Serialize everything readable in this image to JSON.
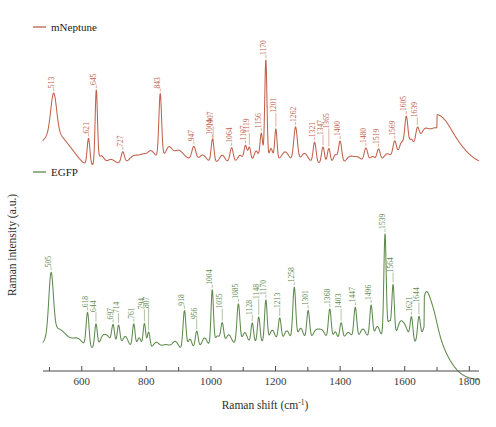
{
  "chart_data": {
    "type": "line",
    "title": "",
    "xlabel": "Raman shift (cm⁻¹)",
    "xlabel_main": "Raman shift (cm",
    "xlabel_sup": "-1",
    "xlabel_tail": ")",
    "ylabel": "Raman intensity (a.u.)",
    "xlim": [
      480,
      1830
    ],
    "grid": false,
    "legend_position": "top-left",
    "xticks_major": [
      600,
      800,
      1000,
      1200,
      1400,
      1600,
      1800
    ],
    "xticks_minor": [
      500,
      700,
      900,
      1100,
      1300,
      1500,
      1700
    ],
    "series": [
      {
        "name": "mNeptune",
        "color": "#c0614b",
        "peaks": [
          513,
          621,
          645,
          727,
          843,
          947,
          1004,
          1007,
          1064,
          1107,
          1119,
          1156,
          1170,
          1201,
          1262,
          1321,
          1347,
          1365,
          1400,
          1480,
          1519,
          1569,
          1605,
          1639
        ],
        "peak_labels": [
          "513",
          "621",
          "645",
          "727",
          "843",
          "947",
          "1004",
          "1007",
          "1064",
          "1107",
          "1119",
          "1156",
          "1170",
          "1201",
          "1262",
          "1321",
          "1347",
          "1365",
          "1400",
          "1480",
          "1519",
          "1569",
          "1605",
          "1639"
        ]
      },
      {
        "name": "EGFP",
        "color": "#5f8a4e",
        "peaks": [
          505,
          618,
          644,
          697,
          714,
          761,
          794,
          807,
          918,
          956,
          1004,
          1035,
          1085,
          1128,
          1148,
          1170,
          1213,
          1258,
          1301,
          1368,
          1403,
          1447,
          1496,
          1539,
          1564,
          1621,
          1644
        ],
        "peak_labels": [
          "505",
          "618",
          "644",
          "697",
          "714",
          "761",
          "794",
          "807",
          "918",
          "956",
          "1004",
          "1035",
          "1085",
          "1128",
          "1148",
          "1170",
          "1213",
          "1258",
          "1301",
          "1368",
          "1403",
          "1447",
          "1496",
          "1539",
          "1564",
          "1621",
          "1644"
        ]
      }
    ]
  },
  "legend": [
    {
      "label": "mNeptune",
      "color": "#c0614b"
    },
    {
      "label": "EGFP",
      "color": "#5f8a4e"
    }
  ],
  "colors": {
    "mneptune": "#c0614b",
    "egfp": "#5f8a4e",
    "axis": "#4a4a4a",
    "background": "#ffffff"
  }
}
